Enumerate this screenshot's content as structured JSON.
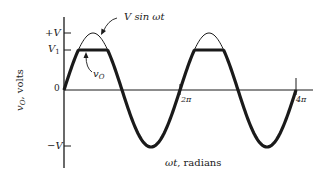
{
  "diagram": {
    "y_axis": {
      "label_var": "v",
      "label_sub": "O",
      "label_rest": ", volts",
      "ticks": [
        {
          "label": "+V",
          "value": "V"
        },
        {
          "label": "V",
          "sub": "1",
          "value": "V1"
        },
        {
          "label": "0",
          "value": "0"
        },
        {
          "label": "−V",
          "value": "-V"
        }
      ]
    },
    "x_axis": {
      "label_var": "ωt",
      "label_rest": ", radians",
      "ticks": [
        {
          "label": "2π",
          "value": "2pi"
        },
        {
          "label": "4π",
          "value": "4pi"
        }
      ]
    },
    "curves": [
      {
        "name": "input",
        "label": "V sin ωt",
        "style": "thin"
      },
      {
        "name": "output",
        "label_var": "v",
        "label_sub": "O",
        "style": "thick",
        "clip_level": "V1"
      }
    ],
    "colors": {
      "ink": "#1a1a1a",
      "background": "#ffffff"
    }
  }
}
